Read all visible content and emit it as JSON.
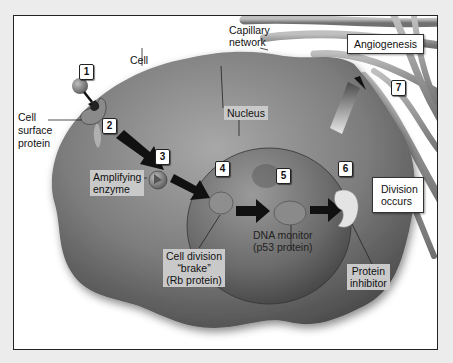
{
  "diagram": {
    "labels": {
      "capillary_network": [
        "Capillary",
        "network"
      ],
      "cell": "Cell",
      "cell_surface_protein": [
        "Cell",
        "surface",
        "protein"
      ],
      "nucleus": "Nucleus",
      "amplifying_enzyme": [
        "Amplifying",
        "enzyme"
      ],
      "cell_division_brake": [
        "Cell division",
        "“brake”",
        "(Rb protein)"
      ],
      "dna_monitor": [
        "DNA monitor",
        "(p53 protein)"
      ],
      "protein_inhibitor": [
        "Protein",
        "inhibitor"
      ],
      "division_occurs": [
        "Division",
        "occurs"
      ],
      "angiogenesis": "Angiogenesis"
    },
    "steps": [
      "1",
      "2",
      "3",
      "4",
      "5",
      "6",
      "7"
    ],
    "colors": {
      "cell_body": "#7a7a7a",
      "nucleus": "#6e6e6e",
      "capillary": "#9a9a9a",
      "arrow": "#111111",
      "label_grey_bg": "#c9c9c9",
      "frame_border": "#222222"
    },
    "icons": [
      "signal-molecule-icon",
      "receptor-icon",
      "arrow-icon",
      "enzyme-icon",
      "rb-protein-icon",
      "p53-protein-icon",
      "inhibitor-icon"
    ]
  }
}
